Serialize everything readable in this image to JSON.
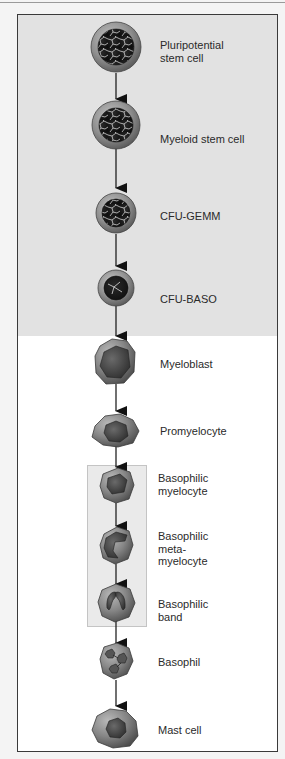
{
  "diagram": {
    "colors": {
      "frame_border": "#3a3a3a",
      "progenitor_background": "#e2e2e2",
      "maturation_background": "#ffffff",
      "highlight_box_background": "#eaeaea",
      "cell_cytoplasm": "#8a8a8a",
      "cell_nucleus": "#3c3c3c",
      "arrow": "#111111"
    },
    "stages": [
      {
        "id": "pluripotential",
        "lines": [
          "Pluripotential",
          "stem cell"
        ],
        "label": "Pluripotential stem cell"
      },
      {
        "id": "myeloid",
        "lines": [
          "Myeloid stem cell"
        ],
        "label": "Myeloid stem cell"
      },
      {
        "id": "cfu-gemm",
        "lines": [
          "CFU-GEMM"
        ],
        "label": "CFU-GEMM"
      },
      {
        "id": "cfu-baso",
        "lines": [
          "CFU-BASO"
        ],
        "label": "CFU-BASO"
      },
      {
        "id": "myeloblast",
        "lines": [
          "Myeloblast"
        ],
        "label": "Myeloblast"
      },
      {
        "id": "promyelocyte",
        "lines": [
          "Promyelocyte"
        ],
        "label": "Promyelocyte"
      },
      {
        "id": "basophilic-myelocyte",
        "lines": [
          "Basophilic",
          "myelocyte"
        ],
        "label": "Basophilic myelocyte"
      },
      {
        "id": "basophilic-metamyelocyte",
        "lines": [
          "Basophilic",
          "meta-",
          "myelocyte"
        ],
        "label": "Basophilic metamyelocyte"
      },
      {
        "id": "basophilic-band",
        "lines": [
          "Basophilic",
          "band"
        ],
        "label": "Basophilic band"
      },
      {
        "id": "basophil",
        "lines": [
          "Basophil"
        ],
        "label": "Basophil"
      },
      {
        "id": "mast-cell",
        "lines": [
          "Mast cell"
        ],
        "label": "Mast cell"
      }
    ],
    "regions": {
      "progenitor_section": [
        "Pluripotential stem cell",
        "Myeloid stem cell",
        "CFU-GEMM",
        "CFU-BASO"
      ],
      "highlighted_group": [
        "Basophilic myelocyte",
        "Basophilic metamyelocyte",
        "Basophilic band"
      ]
    }
  }
}
